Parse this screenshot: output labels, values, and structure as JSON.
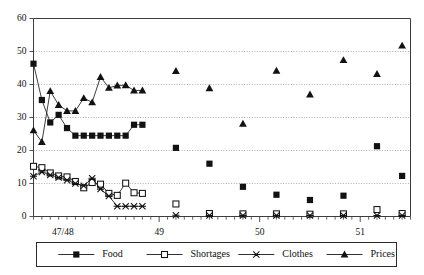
{
  "chart_data": {
    "type": "line",
    "title": "",
    "subtitle": "",
    "xlabel": "",
    "ylabel": "",
    "ylim": [
      0,
      60
    ],
    "yticks": [
      0,
      10,
      20,
      30,
      40,
      50,
      60
    ],
    "ytick_labels": [
      "0",
      "10",
      "20",
      "30",
      "40",
      "50",
      "60"
    ],
    "grid": true,
    "grid_axis": "y",
    "xtick_labels": [
      "47/48",
      "49",
      "50",
      "51"
    ],
    "xtick_positions": [
      3.5,
      15,
      27,
      39
    ],
    "xlim": [
      0,
      45
    ],
    "legend_position": "bottom",
    "legend_entries": [
      "Food",
      "Shortages",
      "Clothes",
      "Prices"
    ],
    "series": [
      {
        "name": "Food",
        "marker": "filled-square",
        "connected": true,
        "x": [
          0,
          1,
          2,
          3,
          4,
          5,
          6,
          7,
          8,
          9,
          10,
          11,
          12,
          13,
          17,
          21,
          25,
          29,
          33,
          37,
          41,
          44
        ],
        "values": [
          46.3,
          35.3,
          28.5,
          30.8,
          26.8,
          24.5,
          24.5,
          24.5,
          24.5,
          24.5,
          24.5,
          24.5,
          27.8,
          27.8,
          20.8,
          16.0,
          9.0,
          6.6,
          5.0,
          6.3,
          21.3,
          12.3
        ]
      },
      {
        "name": "Shortages",
        "marker": "open-square",
        "connected": true,
        "x": [
          0,
          1,
          2,
          3,
          4,
          5,
          6,
          7,
          8,
          9,
          10,
          11,
          12,
          13,
          17,
          21,
          25,
          29,
          33,
          37,
          41,
          44
        ],
        "values": [
          15.2,
          14.8,
          13.2,
          12.3,
          12.0,
          10.6,
          8.7,
          10.3,
          9.8,
          7.0,
          6.4,
          10.1,
          7.2,
          7.0,
          3.8,
          0.9,
          0.8,
          0.8,
          0.7,
          0.8,
          2.1,
          0.9
        ]
      },
      {
        "name": "Clothes",
        "marker": "x-cross",
        "connected": true,
        "x": [
          0,
          1,
          2,
          3,
          4,
          5,
          6,
          7,
          8,
          9,
          10,
          11,
          12,
          13,
          17,
          21,
          25,
          29,
          33,
          37,
          41,
          44
        ],
        "values": [
          12.2,
          13.5,
          12.6,
          11.8,
          11.0,
          10.0,
          9.3,
          11.6,
          8.3,
          6.2,
          3.1,
          3.1,
          3.1,
          3.1,
          0.4,
          0.3,
          0.3,
          0.3,
          0.3,
          0.3,
          0.3,
          0.3
        ]
      },
      {
        "name": "Prices",
        "marker": "filled-triangle",
        "connected": true,
        "x": [
          0,
          1,
          2,
          3,
          4,
          5,
          6,
          7,
          8,
          9,
          10,
          11,
          12,
          13,
          17,
          21,
          25,
          29,
          33,
          37,
          41,
          44
        ],
        "values": [
          26.1,
          22.6,
          38.0,
          33.8,
          32.0,
          32.0,
          35.9,
          34.6,
          42.3,
          39.0,
          39.7,
          39.8,
          38.2,
          38.2,
          44.1,
          38.9,
          28.1,
          44.2,
          37.0,
          47.4,
          43.2,
          51.8
        ]
      }
    ]
  },
  "legend": {
    "items": [
      {
        "label": "Food",
        "marker": "filled-square"
      },
      {
        "label": "Shortages",
        "marker": "open-square"
      },
      {
        "label": "Clothes",
        "marker": "x-cross"
      },
      {
        "label": "Prices",
        "marker": "filled-triangle"
      }
    ]
  }
}
